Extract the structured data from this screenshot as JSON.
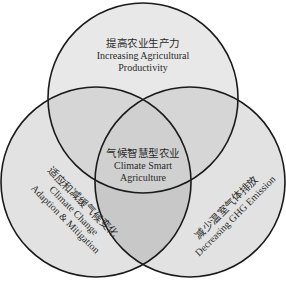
{
  "diagram": {
    "type": "venn-3",
    "colors": {
      "background": "#ffffff",
      "outline": "#1a1a1a",
      "single": "#e6e6e6",
      "pair": "#cfcfcf",
      "center": "#c4c4c4",
      "text": "#2a2a2a"
    },
    "top": {
      "zh": "提高农业生产力",
      "en_line1": "Increasing Agricultural",
      "en_line2": "Productivity"
    },
    "left": {
      "zh": "适应和减缓气候变化",
      "en_line1": "Climate Change",
      "en_line2": "Adaption & Mitigation"
    },
    "right": {
      "zh": "减少温室气体排放",
      "en_line1": "Decreasing GHG Emission"
    },
    "center": {
      "zh": "气候智慧型农业",
      "en_line1": "Climate Smart",
      "en_line2": "Agriculture"
    }
  }
}
